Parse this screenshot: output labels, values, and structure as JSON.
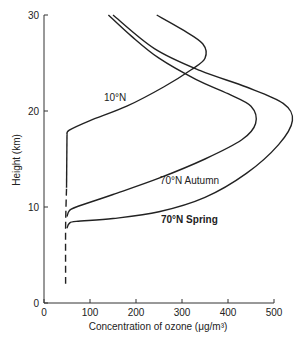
{
  "chart_data": {
    "type": "line",
    "title": "",
    "xlabel": "Concentration of ozone (μg/m³)",
    "ylabel": "Height (km)",
    "xlim": [
      0,
      500
    ],
    "ylim": [
      0,
      30
    ],
    "x_ticks": [
      "0",
      "100",
      "200",
      "300",
      "400",
      "500"
    ],
    "y_ticks": [
      "0",
      "10",
      "20",
      "30"
    ],
    "grid": false,
    "legend": "inline labels",
    "series": [
      {
        "name": "10°N",
        "points": [
          [
            50,
            17.5
          ],
          [
            55,
            18.0
          ],
          [
            100,
            19.0
          ],
          [
            180,
            20.5
          ],
          [
            260,
            22.5
          ],
          [
            320,
            24.3
          ],
          [
            350,
            25.5
          ],
          [
            345,
            27.0
          ],
          [
            300,
            28.5
          ],
          [
            245,
            30.0
          ]
        ]
      },
      {
        "name": "70°N Autumn",
        "points": [
          [
            50,
            9.0
          ],
          [
            55,
            9.6
          ],
          [
            70,
            10.0
          ],
          [
            150,
            11.3
          ],
          [
            250,
            13.0
          ],
          [
            350,
            15.0
          ],
          [
            430,
            17.0
          ],
          [
            460,
            18.7
          ],
          [
            450,
            20.5
          ],
          [
            400,
            21.8
          ],
          [
            330,
            23.3
          ],
          [
            250,
            25.5
          ],
          [
            190,
            27.8
          ],
          [
            140,
            30.0
          ]
        ]
      },
      {
        "name": "70°N Spring",
        "points": [
          [
            50,
            7.8
          ],
          [
            55,
            8.3
          ],
          [
            70,
            8.5
          ],
          [
            150,
            8.8
          ],
          [
            250,
            9.5
          ],
          [
            350,
            11.0
          ],
          [
            440,
            13.5
          ],
          [
            510,
            16.5
          ],
          [
            540,
            19.0
          ],
          [
            520,
            20.8
          ],
          [
            440,
            22.5
          ],
          [
            340,
            24.2
          ],
          [
            240,
            26.5
          ],
          [
            150,
            30.0
          ]
        ]
      },
      {
        "name": "lower dashed segment",
        "style": "dashed",
        "points": [
          [
            47,
            2.0
          ],
          [
            47,
            8.0
          ],
          [
            49,
            12.0
          ]
        ]
      }
    ],
    "annotations": [
      "10°N",
      "70°N Autumn",
      "70°N Spring"
    ]
  },
  "labels": {
    "x_axis": "Concentration of ozone (μg/m³)",
    "y_axis": "Height (km)",
    "s1": "10°N",
    "s2": "70°N Autumn",
    "s3": "70°N Spring"
  }
}
